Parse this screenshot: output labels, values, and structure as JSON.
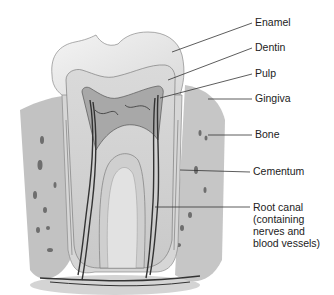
{
  "diagram": {
    "labels": [
      {
        "id": "enamel",
        "text": "Enamel"
      },
      {
        "id": "dentin",
        "text": "Dentin"
      },
      {
        "id": "pulp",
        "text": "Pulp"
      },
      {
        "id": "gingiva",
        "text": "Gingiva"
      },
      {
        "id": "bone",
        "text": "Bone"
      },
      {
        "id": "cementum",
        "text": "Cementum"
      },
      {
        "id": "root-canal",
        "text": "Root canal\n(containing\nnerves and\nblood vessels)"
      }
    ],
    "colors": {
      "enamel": "#e9e9e9",
      "dentin": "#d2d2d2",
      "pulp": "#9a9a9a",
      "bone": "#c4c4c4",
      "gingiva": "#bdbdbd",
      "vessels": "#3a3a3a",
      "leader": "#333333"
    }
  }
}
